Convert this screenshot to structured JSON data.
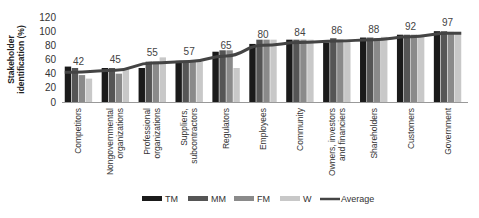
{
  "chart_data": {
    "type": "bar",
    "title": "",
    "xlabel": "",
    "ylabel": "Stakeholder identification (%)",
    "ylabel_lines": [
      "Stakeholder",
      "identification (%)"
    ],
    "ylim": [
      0,
      120
    ],
    "yticks": [
      0,
      20,
      40,
      60,
      80,
      100,
      120
    ],
    "grid": false,
    "legend_position": "bottom",
    "categories": [
      [
        "Competitors"
      ],
      [
        "Nongovernmental",
        "organizations"
      ],
      [
        "Professional",
        "organizations"
      ],
      [
        "Suppliers,",
        "subcontractors"
      ],
      [
        "Regulators"
      ],
      [
        "Employees"
      ],
      [
        "Community"
      ],
      [
        "Owners, investors",
        "and financiers"
      ],
      [
        "Shareholders"
      ],
      [
        "Customers"
      ],
      [
        "Government"
      ]
    ],
    "series": [
      {
        "name": "TM",
        "color": "#1a1a1a",
        "values": [
          50,
          48,
          48,
          58,
          71,
          82,
          88,
          84,
          91,
          95,
          100
        ]
      },
      {
        "name": "MM",
        "color": "#555555",
        "values": [
          48,
          48,
          57,
          58,
          73,
          88,
          88,
          90,
          91,
          95,
          100
        ]
      },
      {
        "name": "FM",
        "color": "#8a8a8a",
        "values": [
          38,
          40,
          57,
          58,
          73,
          88,
          88,
          88,
          90,
          95,
          99
        ]
      },
      {
        "name": "W",
        "color": "#c8c8c8",
        "values": [
          33,
          48,
          63,
          57,
          48,
          88,
          88,
          88,
          92,
          95,
          99
        ]
      }
    ],
    "average": {
      "name": "Average",
      "color": "#444444",
      "values": [
        42,
        45,
        55,
        57,
        65,
        80,
        84,
        86,
        88,
        92,
        97
      ]
    },
    "data_labels": [
      "42",
      "45",
      "55",
      "57",
      "65",
      "80",
      "84",
      "86",
      "88",
      "92",
      "97"
    ]
  }
}
